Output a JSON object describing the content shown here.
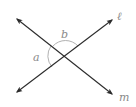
{
  "figure": {
    "lines": [
      {
        "name": "l",
        "label": "ℓ",
        "from": [
          16,
          93
        ],
        "to": [
          113,
          19
        ]
      },
      {
        "name": "m",
        "label": "m",
        "from": [
          16,
          18
        ],
        "to": [
          113,
          95
        ]
      }
    ],
    "intersection": [
      65,
      56
    ],
    "angles": [
      {
        "label": "a",
        "position": "left"
      },
      {
        "label": "b",
        "position": "top"
      }
    ],
    "colors": {
      "line": "#2b2b2b",
      "arc": "#a0a0a0",
      "label": "#8a8a8a"
    }
  }
}
